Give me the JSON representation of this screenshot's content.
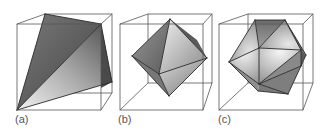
{
  "figure": {
    "panels": [
      {
        "id": "a",
        "label": "(a)",
        "label_pos": [
          15,
          114
        ],
        "solid": "tetrahedron",
        "cube": {
          "back": [
            [
              45,
              14
            ],
            [
              112,
              14
            ],
            [
              112,
              93
            ],
            [
              45,
              93
            ]
          ],
          "front": [
            [
              17,
              24
            ],
            [
              101,
              24
            ],
            [
              101,
              110
            ],
            [
              17,
              110
            ]
          ]
        },
        "faces": [
          {
            "pts": [
              [
                45,
                14
              ],
              [
                101,
                24
              ],
              [
                17,
                110
              ]
            ],
            "fill": "url(#gA1)"
          },
          {
            "pts": [
              [
                101,
                24
              ],
              [
                112,
                82
              ],
              [
                17,
                110
              ]
            ],
            "fill": "url(#gA2)"
          },
          {
            "pts": [
              [
                101,
                24
              ],
              [
                112,
                82
              ],
              [
                101,
                88
              ]
            ],
            "fill": "#4a4a4a"
          }
        ],
        "edges": [
          [
            [
              45,
              14
            ],
            [
              101,
              24
            ]
          ],
          [
            [
              45,
              14
            ],
            [
              17,
              110
            ]
          ],
          [
            [
              101,
              24
            ],
            [
              17,
              110
            ]
          ],
          [
            [
              101,
              24
            ],
            [
              112,
              82
            ]
          ],
          [
            [
              17,
              110
            ],
            [
              112,
              82
            ]
          ]
        ]
      },
      {
        "id": "b",
        "label": "(b)",
        "label_pos": [
          118,
          114
        ],
        "solid": "octahedron",
        "cube": {
          "back": [
            [
              148,
              14
            ],
            [
              212,
              14
            ],
            [
              212,
              83
            ],
            [
              148,
              83
            ]
          ],
          "front": [
            [
              120,
              24
            ],
            [
              203,
              24
            ],
            [
              203,
              110
            ],
            [
              120,
              110
            ]
          ]
        },
        "faces": [
          {
            "pts": [
              [
                170,
                19
              ],
              [
                132,
                56
              ],
              [
                159,
                74
              ]
            ],
            "fill": "url(#gB1)"
          },
          {
            "pts": [
              [
                170,
                19
              ],
              [
                159,
                74
              ],
              [
                207,
                58
              ]
            ],
            "fill": "url(#gB2)"
          },
          {
            "pts": [
              [
                132,
                56
              ],
              [
                159,
                74
              ],
              [
                169,
                96
              ]
            ],
            "fill": "#777777"
          },
          {
            "pts": [
              [
                159,
                74
              ],
              [
                207,
                58
              ],
              [
                169,
                96
              ]
            ],
            "fill": "url(#gB3)"
          },
          {
            "pts": [
              [
                170,
                19
              ],
              [
                207,
                58
              ],
              [
                197,
                40
              ]
            ],
            "fill": "#5a5a5a"
          }
        ],
        "edges": [
          [
            [
              170,
              19
            ],
            [
              132,
              56
            ]
          ],
          [
            [
              170,
              19
            ],
            [
              159,
              74
            ]
          ],
          [
            [
              170,
              19
            ],
            [
              207,
              58
            ]
          ],
          [
            [
              132,
              56
            ],
            [
              159,
              74
            ]
          ],
          [
            [
              159,
              74
            ],
            [
              207,
              58
            ]
          ],
          [
            [
              132,
              56
            ],
            [
              169,
              96
            ]
          ],
          [
            [
              159,
              74
            ],
            [
              169,
              96
            ]
          ],
          [
            [
              207,
              58
            ],
            [
              169,
              96
            ]
          ]
        ]
      },
      {
        "id": "c",
        "label": "(c)",
        "label_pos": [
          218,
          114
        ],
        "solid": "icosahedron",
        "cube": {
          "back": [
            [
              248,
              14
            ],
            [
              313,
              14
            ],
            [
              313,
              83
            ],
            [
              248,
              83
            ]
          ],
          "front": [
            [
              219,
              24
            ],
            [
              303,
              24
            ],
            [
              303,
              110
            ],
            [
              219,
              110
            ]
          ]
        },
        "faces": [
          {
            "pts": [
              [
                255,
                20
              ],
              [
                285,
                20
              ],
              [
                259,
                48
              ]
            ],
            "fill": "url(#gC1)"
          },
          {
            "pts": [
              [
                255,
                20
              ],
              [
                259,
                48
              ],
              [
                229,
                62
              ]
            ],
            "fill": "url(#gC2)"
          },
          {
            "pts": [
              [
                285,
                20
              ],
              [
                301,
                50
              ],
              [
                259,
                48
              ]
            ],
            "fill": "url(#gC2)"
          },
          {
            "pts": [
              [
                229,
                62
              ],
              [
                259,
                48
              ],
              [
                259,
                84
              ]
            ],
            "fill": "url(#gC3)"
          },
          {
            "pts": [
              [
                259,
                48
              ],
              [
                301,
                50
              ],
              [
                259,
                84
              ]
            ],
            "fill": "url(#gC3)"
          },
          {
            "pts": [
              [
                259,
                84
              ],
              [
                301,
                50
              ],
              [
                301,
                66
              ]
            ],
            "fill": "#8a8a8a"
          },
          {
            "pts": [
              [
                229,
                62
              ],
              [
                259,
                84
              ],
              [
                258,
                91
              ]
            ],
            "fill": "#8e8e8e"
          },
          {
            "pts": [
              [
                259,
                84
              ],
              [
                301,
                66
              ],
              [
                288,
                94
              ]
            ],
            "fill": "#7e7e7e"
          },
          {
            "pts": [
              [
                258,
                91
              ],
              [
                259,
                84
              ],
              [
                288,
                94
              ]
            ],
            "fill": "#7a7a7a"
          },
          {
            "pts": [
              [
                285,
                20
              ],
              [
                306,
                55
              ],
              [
                301,
                50
              ]
            ],
            "fill": "#6a6a6a"
          },
          {
            "pts": [
              [
                301,
                50
              ],
              [
                306,
                55
              ],
              [
                301,
                66
              ]
            ],
            "fill": "#5e5e5e"
          }
        ],
        "edges": [
          [
            [
              255,
              20
            ],
            [
              285,
              20
            ]
          ],
          [
            [
              255,
              20
            ],
            [
              259,
              48
            ]
          ],
          [
            [
              285,
              20
            ],
            [
              259,
              48
            ]
          ],
          [
            [
              255,
              20
            ],
            [
              229,
              62
            ]
          ],
          [
            [
              229,
              62
            ],
            [
              259,
              48
            ]
          ],
          [
            [
              259,
              48
            ],
            [
              301,
              50
            ]
          ],
          [
            [
              285,
              20
            ],
            [
              301,
              50
            ]
          ],
          [
            [
              229,
              62
            ],
            [
              259,
              84
            ]
          ],
          [
            [
              259,
              48
            ],
            [
              259,
              84
            ]
          ],
          [
            [
              301,
              50
            ],
            [
              259,
              84
            ]
          ],
          [
            [
              259,
              84
            ],
            [
              301,
              66
            ]
          ],
          [
            [
              229,
              62
            ],
            [
              258,
              91
            ]
          ],
          [
            [
              258,
              91
            ],
            [
              288,
              94
            ]
          ],
          [
            [
              259,
              84
            ],
            [
              288,
              94
            ]
          ],
          [
            [
              288,
              94
            ],
            [
              301,
              66
            ]
          ],
          [
            [
              301,
              50
            ],
            [
              301,
              66
            ]
          ],
          [
            [
              285,
              20
            ],
            [
              306,
              55
            ]
          ],
          [
            [
              306,
              55
            ],
            [
              301,
              66
            ]
          ]
        ]
      }
    ],
    "colors": {
      "cube_line": "#555555",
      "edge_line": "#2a2a2a",
      "label": "#555555"
    }
  }
}
